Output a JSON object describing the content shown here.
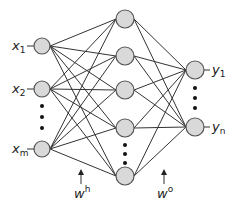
{
  "diagram": {
    "type": "feedforward-neural-network",
    "colors": {
      "node_fill": "#d9d9d9",
      "node_stroke": "#555555",
      "edge": "#333333",
      "background": "#ffffff"
    },
    "layers": {
      "input": {
        "nodes": [
          {
            "label": "x",
            "subscript": "1",
            "cx": 42,
            "cy": 46
          },
          {
            "label": "x",
            "subscript": "2",
            "cx": 42,
            "cy": 89
          },
          {
            "label": "x",
            "subscript": "m",
            "cx": 42,
            "cy": 149
          }
        ],
        "ellipsis_dots": [
          106,
          117,
          128
        ]
      },
      "hidden": {
        "nodes": [
          {
            "cx": 125,
            "cy": 19
          },
          {
            "cx": 125,
            "cy": 56
          },
          {
            "cx": 125,
            "cy": 90
          },
          {
            "cx": 125,
            "cy": 128
          },
          {
            "cx": 125,
            "cy": 176
          }
        ],
        "ellipsis_dots": [
          145,
          154,
          163
        ]
      },
      "output": {
        "nodes": [
          {
            "label": "y",
            "subscript": "1",
            "cx": 195,
            "cy": 70
          },
          {
            "label": "y",
            "subscript": "n",
            "cx": 195,
            "cy": 127
          }
        ],
        "ellipsis_dots": [
          88,
          98,
          108
        ]
      }
    },
    "weights": {
      "hidden": {
        "label": "w",
        "superscript": "h"
      },
      "output": {
        "label": "w",
        "superscript": "o"
      }
    }
  }
}
